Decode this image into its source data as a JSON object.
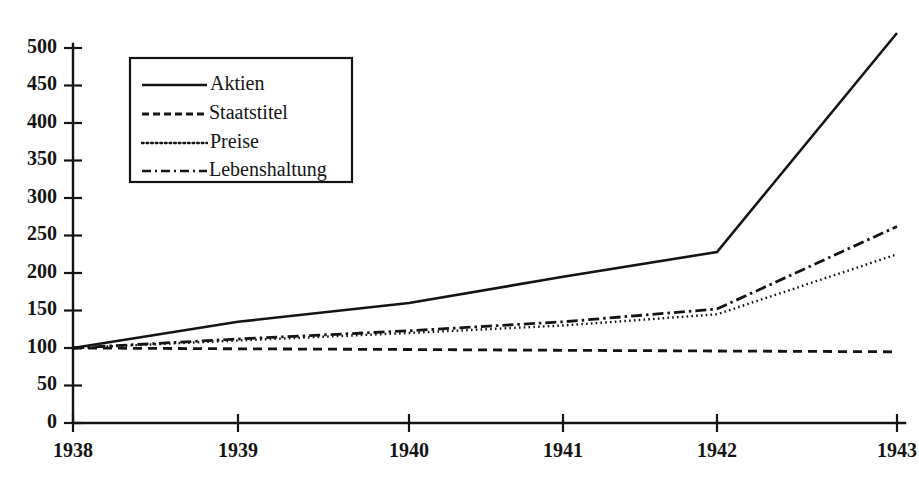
{
  "chart_data": {
    "type": "line",
    "title": "",
    "subtitle": "",
    "xlabel": "",
    "ylabel": "",
    "x": [
      1938,
      1939,
      1940,
      1941,
      1942,
      1943
    ],
    "categories": [
      "1938",
      "1939",
      "1940",
      "1941",
      "1942",
      "1943"
    ],
    "xlim": [
      1938,
      1943
    ],
    "ylim": [
      0,
      500
    ],
    "yticks": [
      0,
      50,
      100,
      150,
      200,
      250,
      300,
      350,
      400,
      450,
      500
    ],
    "ytick_labels": [
      "0",
      "50",
      "100",
      "150",
      "200",
      "250",
      "300",
      "350",
      "400",
      "450",
      "500"
    ],
    "xticks": [
      1938,
      1939,
      1940,
      1941,
      1942,
      1943
    ],
    "xtick_labels": [
      "1938",
      "1939",
      "1940",
      "1941",
      "1942",
      "1943"
    ],
    "grid": false,
    "legend_position": "upper-left-inset",
    "series": [
      {
        "name": "Aktien",
        "style": "solid",
        "values": [
          100,
          135,
          160,
          195,
          228,
          520
        ]
      },
      {
        "name": "Staatstitel",
        "style": "dashed",
        "values": [
          100,
          99,
          98,
          97,
          96,
          95
        ]
      },
      {
        "name": "Preise",
        "style": "dotted",
        "values": [
          100,
          110,
          120,
          130,
          145,
          225
        ]
      },
      {
        "name": "Lebenshaltung",
        "style": "dash-dot",
        "values": [
          100,
          112,
          123,
          135,
          152,
          262
        ]
      }
    ]
  },
  "legend": {
    "entries": [
      {
        "label": "Aktien",
        "style": "solid"
      },
      {
        "label": "Staatstitel",
        "style": "dashed"
      },
      {
        "label": "Preise",
        "style": "dotted"
      },
      {
        "label": "Lebenshaltung",
        "style": "dash-dot"
      }
    ]
  },
  "axes": {
    "y_labels": [
      "500",
      "450",
      "400",
      "350",
      "300",
      "250",
      "200",
      "150",
      "100",
      "50",
      "0"
    ],
    "x_labels": [
      "1938",
      "1939",
      "1940",
      "1941",
      "1942",
      "1943"
    ]
  },
  "colors": {
    "ink": "#141414",
    "background": "#ffffff"
  }
}
